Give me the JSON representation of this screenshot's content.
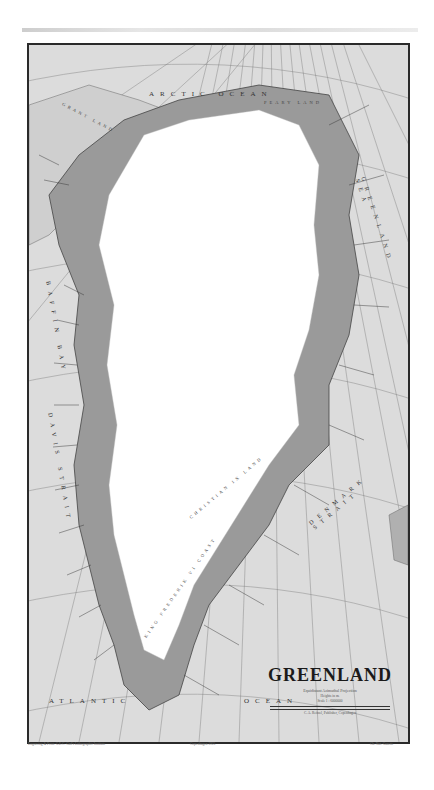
{
  "map": {
    "title": "GREENLAND",
    "projection": "Equidistant Azimuthal Projection",
    "note": "Heights in m.",
    "scale": "Scale 1 : 6000000",
    "publisher": "C. A. Reitzel, Publisher, Copenhagen",
    "scale_bar_ticks": [
      "100",
      "0",
      "100",
      "200",
      "300",
      "400",
      "500 km"
    ],
    "footer_left": "Engraving & Print: G.E.C. Gad's Lithographic Institute",
    "footer_center": "Copenhagen 1925",
    "footer_right": "Ch. Nat. Gazette",
    "bottom_center_label": "40° Long W. Greenw."
  },
  "labels": {
    "arctic_ocean": "ARCTIC OCEAN",
    "grant_land": "GRANT LAND",
    "ellesmere_land": "ELLESMERE LAND",
    "peary_land": "PEARY LAND",
    "greenland_sea": "GREENLAND SEA",
    "baffin_bay": "BAFFIN BAY",
    "davis_strait": "DAVIS STRAIT",
    "denmark_strait": "DENMARK STRAIT",
    "christian_ix_land": "CHRISTIAN IX LAND",
    "king_frederik_vi_coast": "KING FREDERIK VI COAST",
    "atlantic": "ATLANTIC",
    "ocean": "OCEAN",
    "iceland": "ICELAND"
  },
  "colors": {
    "sea": "#dcdcdc",
    "ice": "#ffffff",
    "land": "#9a9a9a",
    "lines": "#555555",
    "frame": "#2a2a2a"
  }
}
